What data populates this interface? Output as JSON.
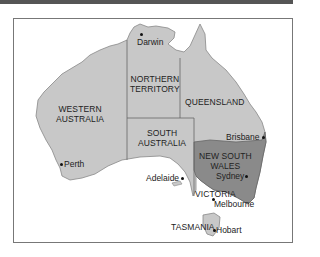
{
  "map": {
    "colors": {
      "land": "#c8c8c8",
      "highlight": "#8a8a8a",
      "border": "#666666",
      "frame": "#777777"
    },
    "regions": [
      {
        "id": "wa",
        "name": "WESTERN AUSTRALIA",
        "line1": "WESTERN",
        "line2": "AUSTRALIA"
      },
      {
        "id": "nt",
        "name": "NORTHERN TERRITORY",
        "line1": "NORTHERN",
        "line2": "TERRITORY"
      },
      {
        "id": "qld",
        "name": "QUEENSLAND",
        "line1": "QUEENSLAND"
      },
      {
        "id": "sa",
        "name": "SOUTH AUSTRALIA",
        "line1": "SOUTH",
        "line2": "AUSTRALIA"
      },
      {
        "id": "nsw",
        "name": "NEW SOUTH WALES",
        "line1": "NEW SOUTH",
        "line2": "WALES",
        "highlighted": true
      },
      {
        "id": "vic",
        "name": "VICTORIA",
        "line1": "VICTORIA"
      },
      {
        "id": "tas",
        "name": "TASMANIA",
        "line1": "TASMANIA"
      }
    ],
    "cities": [
      {
        "name": "Darwin"
      },
      {
        "name": "Brisbane"
      },
      {
        "name": "Sydney"
      },
      {
        "name": "Perth"
      },
      {
        "name": "Adelaide"
      },
      {
        "name": "Melbourne"
      },
      {
        "name": "Hobart"
      }
    ]
  }
}
